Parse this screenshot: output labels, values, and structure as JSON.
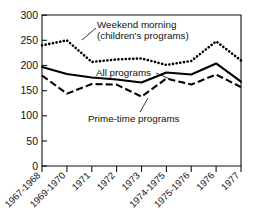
{
  "chart_data": {
    "type": "line",
    "title": "",
    "subtitle": "",
    "xlabel": "",
    "ylabel": "",
    "ylim": [
      0,
      300
    ],
    "yticks": [
      0,
      50,
      100,
      150,
      200,
      250,
      300
    ],
    "ytick_labels": [
      "0",
      "50",
      "100",
      "150",
      "200",
      "250",
      "300"
    ],
    "grid": false,
    "legend_position": "inline-annotations",
    "categories": [
      "1967-1968",
      "1969-1970",
      "1971",
      "1972",
      "1973",
      "1974-1975",
      "1975-1976",
      "1976",
      "1977"
    ],
    "series": [
      {
        "name": "Weekend morning (children's programs)",
        "style": "dotted",
        "values": [
          240,
          250,
          207,
          212,
          214,
          201,
          209,
          248,
          210
        ]
      },
      {
        "name": "All programs",
        "style": "solid",
        "values": [
          197,
          183,
          176,
          172,
          166,
          186,
          182,
          204,
          168
        ]
      },
      {
        "name": "Prime-time programs",
        "style": "dashed",
        "values": [
          180,
          144,
          163,
          162,
          138,
          174,
          162,
          182,
          157
        ]
      }
    ],
    "annotations": [
      {
        "id": "weekend-morning",
        "lines": [
          "Weekend morning",
          "(children's programs)"
        ],
        "target_series": "Weekend morning (children's programs)"
      },
      {
        "id": "all-programs",
        "lines": [
          "All programs"
        ],
        "target_series": "All programs"
      },
      {
        "id": "prime-time-programs",
        "lines": [
          "Prime-time programs"
        ],
        "target_series": "Prime-time programs"
      }
    ]
  }
}
